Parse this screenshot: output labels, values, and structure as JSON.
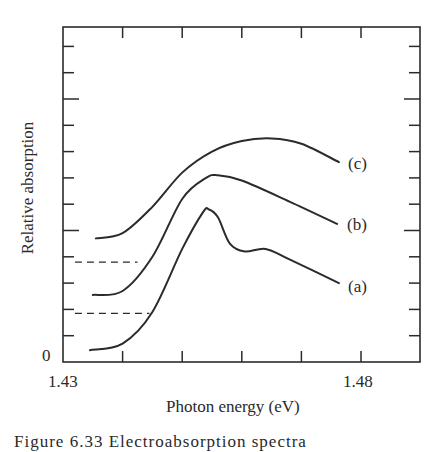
{
  "chart_data": {
    "type": "line",
    "title": "",
    "xlabel": "Photon energy (eV)",
    "ylabel": "Relative absorption",
    "xlim": [
      1.43,
      1.49
    ],
    "ylim": [
      0,
      12.7
    ],
    "x_tick_labels": [
      {
        "value": 1.43,
        "label": "1.43"
      },
      {
        "value": 1.48,
        "label": "1.48"
      }
    ],
    "y_tick_labels": [
      {
        "value": 0,
        "label": "0"
      }
    ],
    "x_ticks": [
      1.43,
      1.44,
      1.45,
      1.46,
      1.47,
      1.48
    ],
    "y_ticks_count": 13,
    "grid": false,
    "series": [
      {
        "name": "(a)",
        "x": [
          1.4345,
          1.44,
          1.445,
          1.45,
          1.4535,
          1.4545,
          1.456,
          1.458,
          1.4605,
          1.464,
          1.468,
          1.4763
        ],
        "y": [
          0.45,
          0.7,
          1.9,
          4.3,
          5.7,
          5.8,
          5.5,
          4.5,
          4.2,
          4.3,
          3.9,
          3.0
        ]
      },
      {
        "name": "(b)",
        "x": [
          1.435,
          1.44,
          1.445,
          1.45,
          1.454,
          1.456,
          1.46,
          1.468,
          1.476
        ],
        "y": [
          2.55,
          2.7,
          4.0,
          6.2,
          7.0,
          7.1,
          6.9,
          6.1,
          5.25
        ]
      },
      {
        "name": "(c)",
        "x": [
          1.4355,
          1.44,
          1.445,
          1.45,
          1.455,
          1.46,
          1.465,
          1.47,
          1.4763
        ],
        "y": [
          4.7,
          4.9,
          5.9,
          7.2,
          8.0,
          8.4,
          8.5,
          8.3,
          7.6
        ]
      }
    ],
    "baselines": [
      {
        "for": "(b)",
        "y": 3.8,
        "x_range": [
          1.432,
          1.4425
        ],
        "style": "dashed"
      },
      {
        "for": "(c)",
        "y": 1.85,
        "x_range": [
          1.432,
          1.4445
        ],
        "style": "dashed"
      }
    ],
    "annotations": [
      "(a)",
      "(b)",
      "(c)"
    ]
  },
  "labels": {
    "ylabel": "Relative absorption",
    "xlabel": "Photon energy (eV)",
    "zero": "0",
    "x_min": "1.43",
    "x_max": "1.48",
    "a": "(a)",
    "b": "(b)",
    "c": "(c)"
  },
  "caption": "Figure 6.33   Electroabsorption spectra"
}
